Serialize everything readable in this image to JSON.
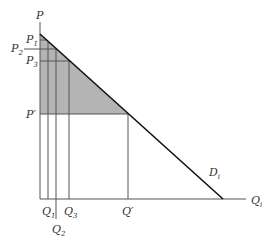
{
  "diagram": {
    "type": "demand-curve-price-discrimination",
    "axes": {
      "y_label": "P",
      "x_label": "Q",
      "x_label_sub": "i"
    },
    "curve": {
      "label": "D",
      "label_sub": "i"
    },
    "price_levels": [
      {
        "label": "P",
        "sub": "1"
      },
      {
        "label": "P",
        "sub": "2"
      },
      {
        "label": "P",
        "sub": "3"
      },
      {
        "label": "P′",
        "sub": ""
      }
    ],
    "quantity_levels": [
      {
        "label": "Q",
        "sub": "1"
      },
      {
        "label": "Q",
        "sub": "2"
      },
      {
        "label": "Q",
        "sub": "3"
      },
      {
        "label": "Q′",
        "sub": ""
      }
    ],
    "colors": {
      "shaded_area": "#b4b4b4",
      "lines": "#555555",
      "demand_line": "#111111"
    }
  }
}
